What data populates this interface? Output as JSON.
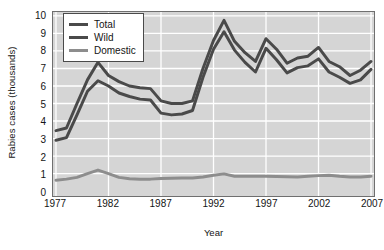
{
  "chart_data": {
    "type": "line",
    "title": "",
    "xlabel": "Year",
    "ylabel": "Rabies cases (thousands)",
    "xlim": [
      1977,
      2007
    ],
    "ylim": [
      0,
      10
    ],
    "grid": true,
    "legend_position": "top-left",
    "plot_background": "#d5d5d5",
    "gridline_color": "#ffffff",
    "x": [
      1977,
      1978,
      1979,
      1980,
      1981,
      1982,
      1983,
      1984,
      1985,
      1986,
      1987,
      1988,
      1989,
      1990,
      1991,
      1992,
      1993,
      1994,
      1995,
      1996,
      1997,
      1998,
      1999,
      2000,
      2001,
      2002,
      2003,
      2004,
      2005,
      2006,
      2007
    ],
    "xticks": [
      1977,
      1982,
      1987,
      1992,
      1997,
      2002,
      2007
    ],
    "xtick_labels": [
      "1977",
      "1982",
      "1987",
      "1992",
      "1997",
      "2002",
      "2007"
    ],
    "yticks": [
      0,
      1,
      2,
      3,
      4,
      5,
      6,
      7,
      8,
      9,
      10
    ],
    "ytick_labels": [
      "0",
      "1",
      "2",
      "3",
      "4",
      "5",
      "6",
      "7",
      "8",
      "9",
      "10"
    ],
    "series": [
      {
        "name": "Total",
        "color": "#4a4a4a",
        "width": 3.0,
        "values": [
          3.45,
          3.6,
          5.0,
          6.35,
          7.35,
          6.6,
          6.25,
          6.0,
          5.9,
          5.85,
          5.15,
          5.0,
          5.0,
          5.15,
          7.0,
          8.6,
          9.75,
          8.55,
          7.9,
          7.4,
          8.7,
          8.1,
          7.3,
          7.6,
          7.7,
          8.2,
          7.4,
          7.1,
          6.6,
          6.9,
          7.4
        ]
      },
      {
        "name": "Wild",
        "color": "#4a4a4a",
        "width": 3.0,
        "values": [
          2.9,
          3.05,
          4.35,
          5.7,
          6.3,
          6.0,
          5.6,
          5.4,
          5.25,
          5.2,
          4.45,
          4.35,
          4.4,
          4.6,
          6.5,
          8.1,
          9.1,
          8.05,
          7.35,
          6.8,
          8.15,
          7.5,
          6.75,
          7.05,
          7.15,
          7.55,
          6.8,
          6.5,
          6.15,
          6.35,
          6.95
        ]
      },
      {
        "name": "Domestic",
        "color": "#8d8d8d",
        "width": 3.0,
        "values": [
          0.62,
          0.68,
          0.78,
          1.0,
          1.2,
          1.0,
          0.78,
          0.7,
          0.68,
          0.68,
          0.72,
          0.73,
          0.74,
          0.75,
          0.8,
          0.9,
          0.98,
          0.85,
          0.84,
          0.85,
          0.84,
          0.83,
          0.82,
          0.8,
          0.85,
          0.88,
          0.9,
          0.84,
          0.8,
          0.8,
          0.85
        ]
      }
    ]
  },
  "legend": {
    "items": [
      {
        "label": "Total",
        "color": "#4a4a4a"
      },
      {
        "label": "Wild",
        "color": "#4a4a4a"
      },
      {
        "label": "Domestic",
        "color": "#8d8d8d"
      }
    ]
  }
}
